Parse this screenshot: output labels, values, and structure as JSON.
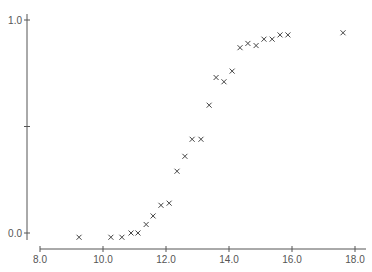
{
  "chart_data": {
    "type": "scatter",
    "title": "",
    "xlabel": "",
    "ylabel": "",
    "marker": "x",
    "grid": false,
    "legend": null,
    "xlim": [
      8.0,
      18.0
    ],
    "ylim": [
      0.0,
      1.0
    ],
    "x_ticks": [
      8.0,
      10.0,
      12.0,
      14.0,
      16.0,
      18.0
    ],
    "x_tick_labels": [
      "8.0",
      "10.0",
      "12.0",
      "14.0",
      "16.0",
      "18.0"
    ],
    "y_ticks": [
      0.0,
      0.5,
      1.0
    ],
    "y_tick_labels": [
      "0.0",
      "",
      "1.0"
    ],
    "series": [
      {
        "name": "data",
        "x": [
          9.24,
          10.25,
          10.6,
          10.89,
          11.11,
          11.37,
          11.59,
          11.84,
          12.1,
          12.35,
          12.6,
          12.83,
          13.11,
          13.37,
          13.59,
          13.84,
          14.1,
          14.35,
          14.6,
          14.86,
          15.11,
          15.37,
          15.62,
          15.87,
          17.62
        ],
        "y": [
          -0.02,
          -0.02,
          -0.02,
          0.0,
          0.0,
          0.04,
          0.08,
          0.13,
          0.14,
          0.29,
          0.36,
          0.44,
          0.44,
          0.6,
          0.73,
          0.71,
          0.76,
          0.87,
          0.89,
          0.88,
          0.91,
          0.91,
          0.93,
          0.93,
          0.94
        ]
      }
    ]
  },
  "colors": {
    "axis": "#555555",
    "marker": "#444444",
    "background": "#ffffff"
  }
}
